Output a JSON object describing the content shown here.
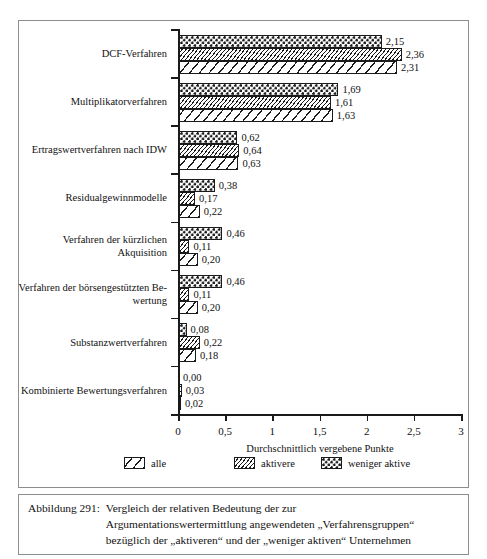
{
  "chart_data": {
    "type": "bar",
    "orientation": "horizontal",
    "title": "",
    "xlabel": "Durchschnittlich vergebene Punkte",
    "ylabel": "",
    "xlim": [
      0,
      3
    ],
    "xticks": [
      "0",
      "0,5",
      "1",
      "1,5",
      "2",
      "2,5",
      "3"
    ],
    "xtick_values": [
      0,
      0.5,
      1,
      1.5,
      2,
      2.5,
      3
    ],
    "grid": false,
    "legend_position": "bottom",
    "categories": [
      "DCF-Verfahren",
      "Multiplikatorverfahren",
      "Ertragswertverfahren nach IDW",
      "Residualgewinnmodelle",
      "Verfahren der kürzlichen Akquisition",
      "Verfahren der börsengestützten Bewertung",
      "Substanzwertverfahren",
      "Kombinierte Bewertungsverfahren"
    ],
    "category_lines": [
      [
        "DCF-Verfahren"
      ],
      [
        "Multiplikatorverfahren"
      ],
      [
        "Ertragswertverfahren nach IDW"
      ],
      [
        "Residualgewinnmodelle"
      ],
      [
        "Verfahren der kürzlichen",
        "Akquisition"
      ],
      [
        "Verfahren der börsengestützten Be-",
        "wertung"
      ],
      [
        "Substanzwertverfahren"
      ],
      [
        "Kombinierte Bewertungsverfahren"
      ]
    ],
    "series": [
      {
        "name": "weniger aktive",
        "pattern": "dotted",
        "values": [
          2.15,
          1.69,
          0.62,
          0.38,
          0.46,
          0.46,
          0.08,
          0.0
        ],
        "labels": [
          "2,15",
          "1,69",
          "0,62",
          "0,38",
          "0,46",
          "0,46",
          "0,08",
          "0,00"
        ]
      },
      {
        "name": "aktivere",
        "pattern": "fine-hatch",
        "values": [
          2.36,
          1.61,
          0.64,
          0.17,
          0.11,
          0.11,
          0.22,
          0.03
        ],
        "labels": [
          "2,36",
          "1,61",
          "0,64",
          "0,17",
          "0,11",
          "0,11",
          "0,22",
          "0,03"
        ]
      },
      {
        "name": "alle",
        "pattern": "diagonal-stripe",
        "values": [
          2.31,
          1.63,
          0.63,
          0.22,
          0.2,
          0.2,
          0.18,
          0.02
        ],
        "labels": [
          "2,31",
          "1,63",
          "0,63",
          "0,22",
          "0,20",
          "0,20",
          "0,18",
          "0,02"
        ]
      }
    ],
    "legend": [
      {
        "label": "alle",
        "pattern": "diagonal-stripe"
      },
      {
        "label": "aktivere",
        "pattern": "fine-hatch"
      },
      {
        "label": "weniger aktive",
        "pattern": "dotted"
      }
    ]
  },
  "caption": {
    "number": "Abbildung 291:",
    "lines": [
      "Vergleich der relativen Bedeutung der zur",
      "Argumentationswertermittlung angewendeten „Verfahrensgruppen“",
      "bezüglich der „aktiveren“ und der „weniger aktiven“ Unternehmen"
    ]
  }
}
